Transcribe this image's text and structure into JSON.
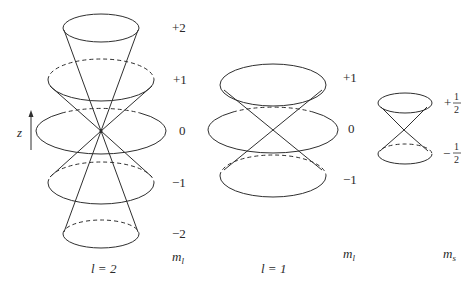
{
  "figure": {
    "type": "vector-model-diagram",
    "axis_label": "z",
    "panels": [
      {
        "id": "l2",
        "caption": "l = 2",
        "column_label": "m",
        "column_label_sub": "l",
        "levels": [
          {
            "label": "+2",
            "cy": 28,
            "rx": 38,
            "ry": 14
          },
          {
            "label": "+1",
            "cy": 80,
            "rx": 53,
            "ry": 21
          },
          {
            "label": "0",
            "cy": 131,
            "rx": 65,
            "ry": 23
          },
          {
            "label": "−1",
            "cy": 183,
            "rx": 53,
            "ry": 21
          },
          {
            "label": "−2",
            "cy": 234,
            "rx": 38,
            "ry": 14
          }
        ]
      },
      {
        "id": "l1",
        "caption": "l = 1",
        "column_label": "m",
        "column_label_sub": "l",
        "levels": [
          {
            "label": "+1",
            "cy": 85,
            "rx": 53,
            "ry": 21
          },
          {
            "label": "0",
            "cy": 130,
            "rx": 65,
            "ry": 23
          },
          {
            "label": "−1",
            "cy": 176,
            "rx": 53,
            "ry": 21
          }
        ]
      },
      {
        "id": "s",
        "caption": "",
        "column_label": "m",
        "column_label_sub": "s",
        "levels": [
          {
            "label_sign": "+",
            "label_num": "1",
            "label_den": "2",
            "cy": 103,
            "rx": 27,
            "ry": 10
          },
          {
            "label_sign": "−",
            "label_num": "1",
            "label_den": "2",
            "cy": 154,
            "rx": 27,
            "ry": 10
          }
        ]
      }
    ]
  }
}
